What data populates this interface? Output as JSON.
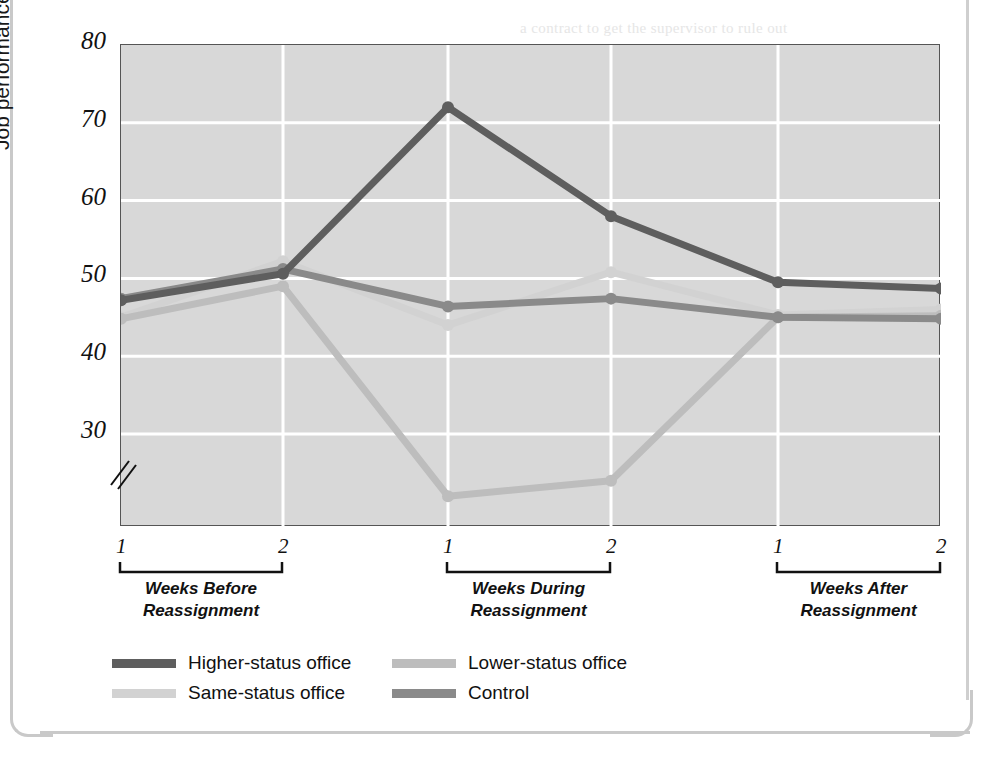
{
  "chart_data": {
    "type": "line",
    "title": "",
    "xlabel": "",
    "ylabel": "Job performance",
    "ylim": [
      22,
      80
    ],
    "yticks": [
      80,
      70,
      60,
      50,
      40,
      30
    ],
    "axis_break": true,
    "grid": true,
    "legend_position": "bottom-left",
    "x": [
      "1",
      "2",
      "1",
      "2",
      "1",
      "2"
    ],
    "xtick_labels": [
      "1",
      "2",
      "1",
      "2",
      "1",
      "2"
    ],
    "x_groups": [
      {
        "label": "Weeks Before\nReassignment",
        "line1": "Weeks Before",
        "line2": "Reassignment",
        "from": 0,
        "to": 1
      },
      {
        "label": "Weeks During\nReassignment",
        "line1": "Weeks During",
        "line2": "Reassignment",
        "from": 2,
        "to": 3
      },
      {
        "label": "Weeks After\nReassignment",
        "line1": "Weeks After",
        "line2": "Reassignment",
        "from": 4,
        "to": 5
      }
    ],
    "series": [
      {
        "name": "Higher-status office",
        "color": "#5e5e5e",
        "values": [
          47.2,
          50.6,
          72.0,
          58.0,
          49.5,
          48.7
        ]
      },
      {
        "name": "Lower-status office",
        "color": "#bdbdbd",
        "values": [
          44.8,
          49.0,
          22.0,
          24.0,
          45.0,
          45.2
        ]
      },
      {
        "name": "Same-status office",
        "color": "#d2d2d2",
        "values": [
          45.0,
          52.2,
          44.0,
          50.8,
          45.3,
          46.0
        ]
      },
      {
        "name": "Control",
        "color": "#8a8a8a",
        "values": [
          47.4,
          51.2,
          46.4,
          47.4,
          45.0,
          44.8
        ]
      }
    ]
  },
  "legend": {
    "entries": [
      {
        "label": "Higher-status office",
        "color": "#5e5e5e"
      },
      {
        "label": "Lower-status office",
        "color": "#bdbdbd"
      },
      {
        "label": "Same-status office",
        "color": "#d2d2d2"
      },
      {
        "label": "Control",
        "color": "#8a8a8a"
      }
    ]
  },
  "bleed_text": {
    "lines": [
      "a contract to get the supervisor to rule out",
      "of independence. Because the job status",
      "been altered, these workers",
      "were no longer getting the same respect",
      "During the study, the entire group of workers",
      "declined in performance when they experienced",
      "the temporary loss of status. Over the",
      "period, they recovered when the higher-status",
      "position was restored. A review of the data over the",
      "course of the full study indicated that such losses",
      "relative to the initial status remained stable"
    ]
  }
}
